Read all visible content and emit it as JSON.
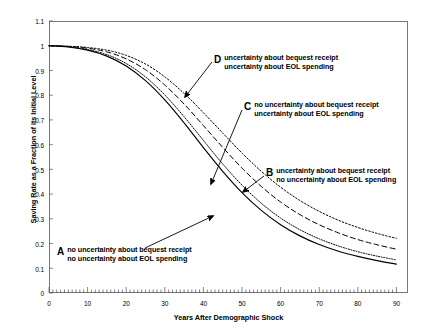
{
  "chart_data": {
    "type": "line",
    "title": "",
    "xlabel": "Years After Demographic Shock",
    "ylabel": "Saving Rate as a Fraction of its Initial Level",
    "xlim": [
      0,
      93
    ],
    "ylim": [
      0,
      1.1
    ],
    "xticks": [
      0,
      10,
      20,
      30,
      40,
      50,
      60,
      70,
      80,
      90
    ],
    "yticks": [
      "0",
      "0.1",
      "0.2",
      "0.3",
      "0.4",
      "0.5",
      "0.6",
      "0.7",
      "0.8",
      "0.9",
      "1",
      "1.1"
    ],
    "x_minor_tick_step": 1,
    "grid": false,
    "legend": "inline-annotations",
    "x": [
      0,
      5,
      10,
      15,
      20,
      25,
      30,
      35,
      40,
      45,
      50,
      55,
      60,
      65,
      70,
      75,
      80,
      85,
      90
    ],
    "series": [
      {
        "name": "A",
        "key": "A",
        "style": "solid",
        "color": "#000000",
        "label_line1": "no uncertainty about bequest receipt",
        "label_line2": "no uncertainty about EOL spending",
        "values": [
          1.0,
          0.995,
          0.982,
          0.958,
          0.918,
          0.859,
          0.781,
          0.688,
          0.588,
          0.492,
          0.406,
          0.334,
          0.276,
          0.231,
          0.196,
          0.169,
          0.148,
          0.131,
          0.117
        ]
      },
      {
        "name": "B",
        "key": "B",
        "style": "fine-dotted",
        "color": "#000000",
        "label_line1": "uncertainty about bequest receipt",
        "label_line2": "no uncertainty about EOL spending",
        "values": [
          1.0,
          0.996,
          0.985,
          0.964,
          0.928,
          0.874,
          0.801,
          0.713,
          0.617,
          0.522,
          0.436,
          0.363,
          0.303,
          0.256,
          0.219,
          0.19,
          0.167,
          0.149,
          0.134
        ]
      },
      {
        "name": "C",
        "key": "C",
        "style": "dashed",
        "color": "#000000",
        "label_line1": "no uncertainty about bequest receipt",
        "label_line2": "uncertainty about EOL spending",
        "values": [
          1.0,
          0.997,
          0.99,
          0.975,
          0.947,
          0.903,
          0.841,
          0.764,
          0.677,
          0.589,
          0.505,
          0.431,
          0.368,
          0.317,
          0.276,
          0.243,
          0.216,
          0.195,
          0.177
        ]
      },
      {
        "name": "D",
        "key": "D",
        "style": "dotted",
        "color": "#000000",
        "label_line1": "uncertainty about bequest receipt",
        "label_line2": "uncertainty about EOL spending",
        "values": [
          1.0,
          0.998,
          0.993,
          0.982,
          0.961,
          0.926,
          0.874,
          0.807,
          0.729,
          0.647,
          0.566,
          0.492,
          0.428,
          0.374,
          0.33,
          0.294,
          0.265,
          0.241,
          0.221
        ]
      }
    ],
    "annotations": [
      {
        "key": "D",
        "line1": "uncertainty about bequest receipt",
        "line2": "uncertainty about EOL spending"
      },
      {
        "key": "C",
        "line1": "no uncertainty about bequest receipt",
        "line2": "uncertainty about EOL spending"
      },
      {
        "key": "B",
        "line1": "uncertainty about bequest receipt",
        "line2": "no uncertainty about EOL spending"
      },
      {
        "key": "A",
        "line1": "no uncertainty about bequest receipt",
        "line2": "no uncertainty about EOL spending"
      }
    ]
  }
}
